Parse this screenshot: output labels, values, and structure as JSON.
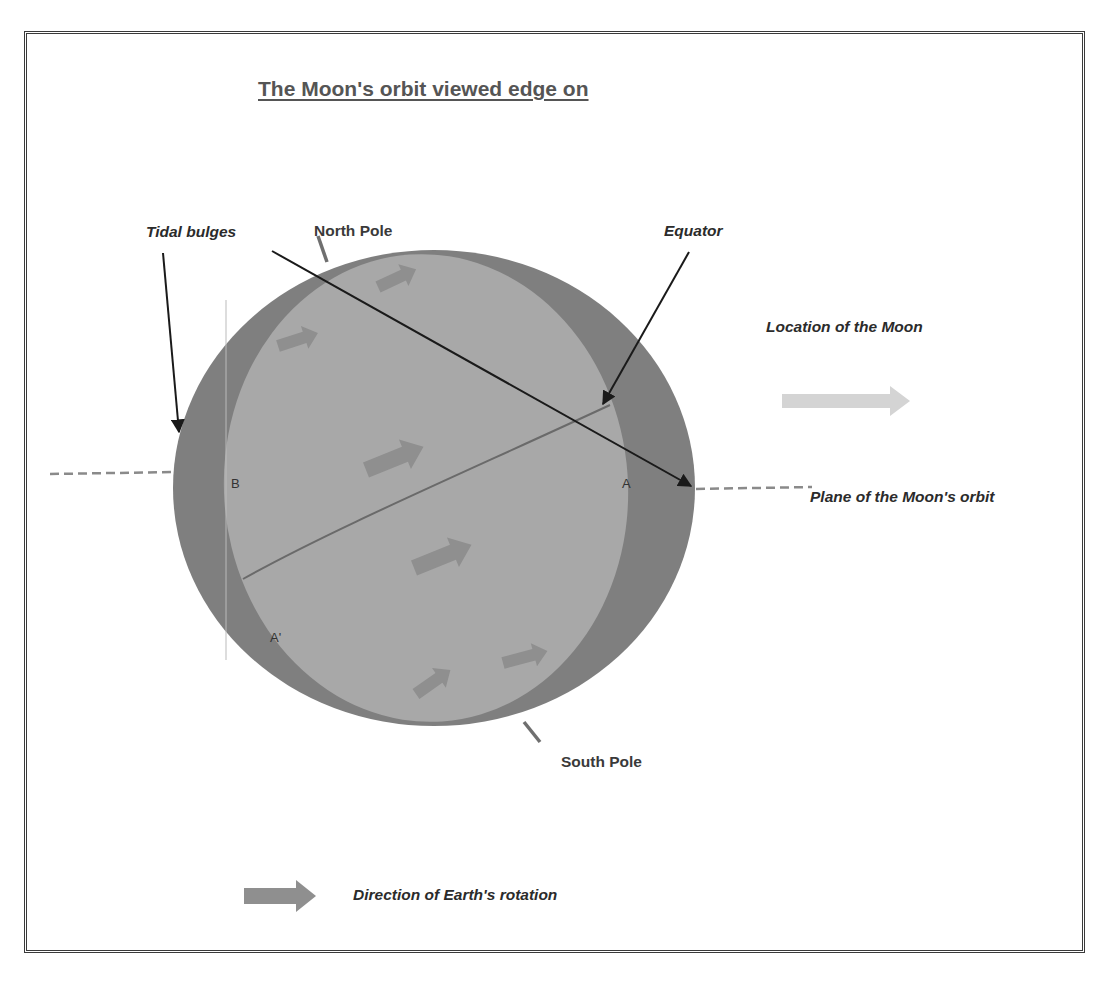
{
  "diagram": {
    "title": "The Moon's orbit viewed edge on",
    "labels": {
      "tidal_bulges": "Tidal bulges",
      "north_pole": "North Pole",
      "south_pole": "South Pole",
      "equator": "Equator",
      "location_of_moon": "Location of the Moon",
      "plane_of_orbit": "Plane of the Moon's orbit",
      "point_a": "A",
      "point_b": "B",
      "point_a_prime": "A'"
    },
    "legend": {
      "rotation_label": "Direction of Earth's rotation"
    },
    "colors": {
      "bulge_outer": "#7d7d7d",
      "earth_inner": "#a6a6a6",
      "rotation_arrow": "#8c8c8c",
      "moon_arrow": "#d4d4d4",
      "line": "#1a1a1a",
      "border": "#3a3a3a"
    }
  }
}
